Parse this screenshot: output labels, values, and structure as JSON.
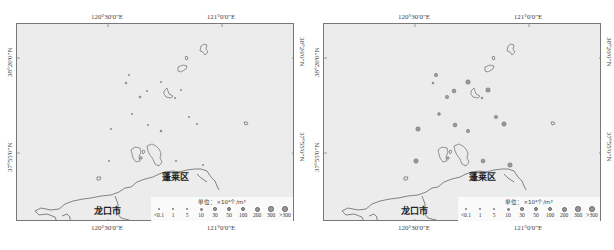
{
  "colors": {
    "sea": "#ececec",
    "frame": "#777777",
    "coastline": "#555555",
    "symbol_fill": "#999999",
    "legend_bg": "#fafafa"
  },
  "axes": {
    "lon_labels": [
      "120°30'0\"E",
      "121°0'0\"E"
    ],
    "lat_labels": [
      "38°20'0\"N",
      "37°55'0\"N"
    ]
  },
  "places": {
    "longkou": "龙口市",
    "penglai": "蓬莱区"
  },
  "legend": {
    "title": "单位：×10⁴个/m³",
    "classes": [
      "<0.1",
      "1",
      "5",
      "10",
      "30",
      "50",
      "100",
      "200",
      "300",
      ">300"
    ],
    "symbol_sizes": [
      1.5,
      2,
      2,
      3,
      3.5,
      4,
      4.5,
      5,
      5.5,
      6
    ]
  },
  "panels": [
    {
      "id": "left",
      "stations": [
        {
          "x": 128,
          "y": 74,
          "c": 0
        },
        {
          "x": 125,
          "y": 82,
          "c": 1
        },
        {
          "x": 146,
          "y": 90,
          "c": 0
        },
        {
          "x": 139,
          "y": 96,
          "c": 1
        },
        {
          "x": 160,
          "y": 81,
          "c": 0
        },
        {
          "x": 180,
          "y": 89,
          "c": 0
        },
        {
          "x": 174,
          "y": 97,
          "c": 0
        },
        {
          "x": 131,
          "y": 113,
          "c": 0
        },
        {
          "x": 147,
          "y": 124,
          "c": 0
        },
        {
          "x": 110,
          "y": 128,
          "c": 0
        },
        {
          "x": 188,
          "y": 116,
          "c": 0
        },
        {
          "x": 160,
          "y": 130,
          "c": 1
        },
        {
          "x": 196,
          "y": 123,
          "c": 0
        },
        {
          "x": 202,
          "y": 164,
          "c": 0
        },
        {
          "x": 108,
          "y": 160,
          "c": 0
        },
        {
          "x": 175,
          "y": 160,
          "c": 0
        }
      ]
    },
    {
      "id": "right",
      "stations": [
        {
          "x": 128,
          "y": 74,
          "c": 4
        },
        {
          "x": 125,
          "y": 82,
          "c": 2
        },
        {
          "x": 146,
          "y": 90,
          "c": 5
        },
        {
          "x": 139,
          "y": 96,
          "c": 4
        },
        {
          "x": 160,
          "y": 81,
          "c": 6
        },
        {
          "x": 180,
          "y": 89,
          "c": 6
        },
        {
          "x": 174,
          "y": 97,
          "c": 1
        },
        {
          "x": 131,
          "y": 113,
          "c": 3
        },
        {
          "x": 147,
          "y": 124,
          "c": 5
        },
        {
          "x": 110,
          "y": 128,
          "c": 6
        },
        {
          "x": 188,
          "y": 116,
          "c": 4
        },
        {
          "x": 160,
          "y": 130,
          "c": 4
        },
        {
          "x": 196,
          "y": 123,
          "c": 6
        },
        {
          "x": 202,
          "y": 164,
          "c": 6
        },
        {
          "x": 108,
          "y": 160,
          "c": 6
        },
        {
          "x": 175,
          "y": 160,
          "c": 5
        }
      ]
    }
  ]
}
